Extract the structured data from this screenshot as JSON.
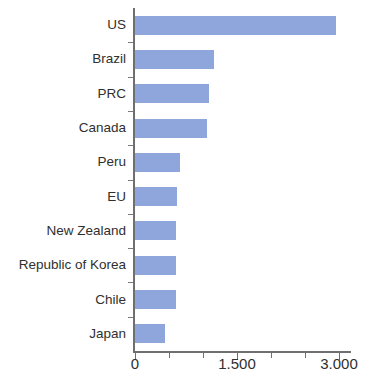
{
  "chart_data": {
    "type": "bar",
    "orientation": "horizontal",
    "title": "",
    "subtitle": "",
    "xlabel": "",
    "ylabel": "",
    "categories": [
      "US",
      "Brazil",
      "PRC",
      "Canada",
      "Peru",
      "EU",
      "New Zealand",
      "Republic of Korea",
      "Chile",
      "Japan"
    ],
    "values": [
      2950,
      1160,
      1090,
      1060,
      660,
      620,
      600,
      600,
      600,
      440
    ],
    "series": [
      {
        "name": "",
        "values": [
          2950,
          1160,
          1090,
          1060,
          660,
          620,
          600,
          600,
          600,
          440
        ]
      }
    ],
    "xlim": [
      0,
      3200
    ],
    "ylim": [
      0,
      10
    ],
    "xticks": [
      0,
      1500,
      3000
    ],
    "xtick_labels": [
      "0",
      "1.500",
      "3.000"
    ],
    "grid": false,
    "legend": false,
    "legend_position": "none",
    "bar_color": "#8fa6dd",
    "axis_color": "#6f6f6f",
    "text_color": "#2f2f2f",
    "annotations": []
  },
  "axis": {
    "x_tick_labels": [
      "0",
      "1.500",
      "3.000"
    ],
    "x_tick_values": [
      0,
      1500,
      3000
    ]
  },
  "bars": [
    {
      "label": "US",
      "value": 2950
    },
    {
      "label": "Brazil",
      "value": 1160
    },
    {
      "label": "PRC",
      "value": 1090
    },
    {
      "label": "Canada",
      "value": 1060
    },
    {
      "label": "Peru",
      "value": 660
    },
    {
      "label": "EU",
      "value": 620
    },
    {
      "label": "New Zealand",
      "value": 600
    },
    {
      "label": "Republic of Korea",
      "value": 600
    },
    {
      "label": "Chile",
      "value": 600
    },
    {
      "label": "Japan",
      "value": 440
    }
  ]
}
